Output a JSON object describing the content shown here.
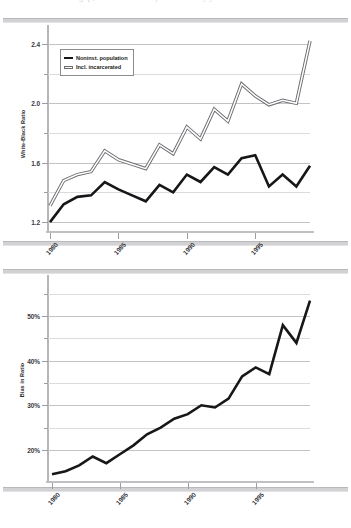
{
  "caption": {
    "text": "black-white gap, incarceration adjusted ratio by year"
  },
  "colors": {
    "series_dark": "#17171a",
    "series_light_fill": "#ffffff",
    "series_light_stroke": "#6d6d72",
    "grid": "#c3c3c6",
    "axis": "#b6b6ba"
  },
  "legend": {
    "items": [
      {
        "label": "Noninst. population",
        "style": "solid-dark",
        "swatch": "line-swatch-dark"
      },
      {
        "label": "Incl. incarcerated",
        "style": "outlined-light",
        "swatch": "line-swatch-light"
      }
    ]
  },
  "chart_data": [
    {
      "id": "top",
      "type": "line",
      "title": "",
      "ylabel": "White-Black Ratio",
      "xlabel": "",
      "ylim": [
        1.14,
        2.46
      ],
      "yticks": [
        "1.2",
        "1.6",
        "2.0",
        "2.4"
      ],
      "ytick_values": [
        1.2,
        1.6,
        2.0,
        2.4
      ],
      "yminor_values": [
        1.4,
        1.8,
        2.2
      ],
      "grid": true,
      "legend_position": "upper-left",
      "x": [
        1980,
        1981,
        1982,
        1983,
        1984,
        1985,
        1986,
        1987,
        1988,
        1989,
        1990,
        1991,
        1992,
        1993,
        1994,
        1995,
        1996,
        1997,
        1998,
        1999
      ],
      "xticks": [
        "1980",
        "1985",
        "1990",
        "1995"
      ],
      "xtick_values": [
        1980,
        1985,
        1990,
        1995
      ],
      "series": [
        {
          "name": "Noninst. population",
          "values": [
            1.2,
            1.32,
            1.37,
            1.38,
            1.47,
            1.42,
            1.38,
            1.34,
            1.45,
            1.4,
            1.52,
            1.47,
            1.57,
            1.52,
            1.63,
            1.65,
            1.44,
            1.52,
            1.44,
            1.58
          ]
        },
        {
          "name": "Incl. incarcerated",
          "values": [
            1.31,
            1.48,
            1.52,
            1.54,
            1.68,
            1.62,
            1.59,
            1.56,
            1.72,
            1.66,
            1.84,
            1.76,
            1.96,
            1.88,
            2.13,
            2.05,
            1.99,
            2.02,
            2.0,
            2.42
          ]
        }
      ]
    },
    {
      "id": "bottom",
      "type": "line",
      "title": "",
      "ylabel": "Bias in Ratio",
      "xlabel": "",
      "ylim": [
        13,
        57
      ],
      "yticks": [
        "20%",
        "30%",
        "40%",
        "50%"
      ],
      "ytick_values": [
        20,
        30,
        40,
        50
      ],
      "yminor_values": [
        25,
        35,
        45,
        55
      ],
      "grid": true,
      "legend_position": "none",
      "x": [
        1980,
        1981,
        1982,
        1983,
        1984,
        1985,
        1986,
        1987,
        1988,
        1989,
        1990,
        1991,
        1992,
        1993,
        1994,
        1995,
        1996,
        1997,
        1998,
        1999
      ],
      "xticks": [
        "1980",
        "1985",
        "1990",
        "1995"
      ],
      "xtick_values": [
        1980,
        1985,
        1990,
        1995
      ],
      "series": [
        {
          "name": "Bias in Ratio",
          "values": [
            14.5,
            15.2,
            16.5,
            18.5,
            17.0,
            19.0,
            21.0,
            23.5,
            25.0,
            27.0,
            28.0,
            30.0,
            29.5,
            31.5,
            36.5,
            38.5,
            37.0,
            48.0,
            44.0,
            53.5
          ]
        }
      ]
    }
  ]
}
